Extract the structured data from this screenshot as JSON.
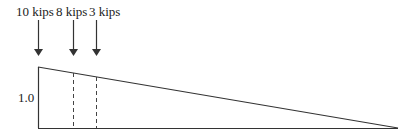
{
  "diagram": {
    "type": "influence-line",
    "loads": [
      {
        "label": "10 kips",
        "x": 38
      },
      {
        "label": "8 kips",
        "x": 73
      },
      {
        "label": "3 kips",
        "x": 96
      }
    ],
    "ordinate_label": "1.0",
    "colors": {
      "line": "#333333",
      "text": "#222222"
    }
  }
}
